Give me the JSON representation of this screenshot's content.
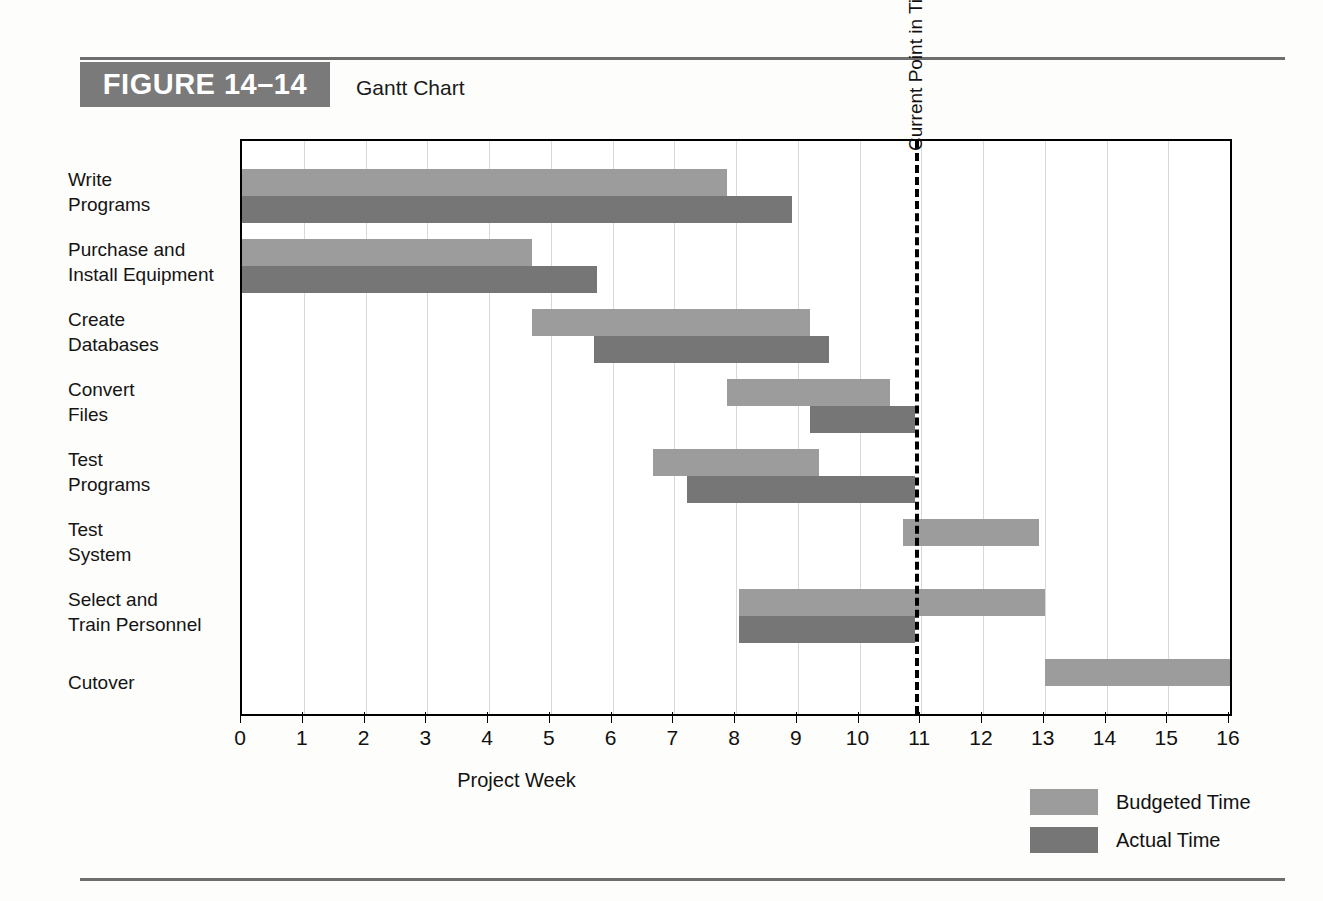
{
  "figure": {
    "tag": "FIGURE 14–14",
    "title": "Gantt Chart"
  },
  "chart_data": {
    "type": "bar",
    "orientation": "horizontal",
    "subtype": "gantt",
    "title": "Gantt Chart",
    "xlabel": "Project Week",
    "ylabel": "",
    "xlim": [
      0,
      16
    ],
    "xticks": [
      0,
      1,
      2,
      3,
      4,
      5,
      6,
      7,
      8,
      9,
      10,
      11,
      12,
      13,
      14,
      15,
      16
    ],
    "grid": true,
    "legend_position": "bottom-right",
    "legend": [
      "Budgeted Time",
      "Actual Time"
    ],
    "annotations": [
      {
        "label": "Current Point in Time",
        "x": 10.9,
        "type": "vertical-dashed-line"
      }
    ],
    "categories": [
      "Write Programs",
      "Purchase and Install Equipment",
      "Create Databases",
      "Convert Files",
      "Test Programs",
      "Test System",
      "Select and Train Personnel",
      "Cutover"
    ],
    "tasks": [
      {
        "name": "Write Programs",
        "label_lines": [
          "Write",
          "Programs"
        ],
        "budgeted": {
          "start": 0,
          "end": 7.85
        },
        "actual": {
          "start": 0,
          "end": 8.9
        }
      },
      {
        "name": "Purchase and Install Equipment",
        "label_lines": [
          "Purchase and",
          "Install Equipment"
        ],
        "budgeted": {
          "start": 0,
          "end": 4.7
        },
        "actual": {
          "start": 0,
          "end": 5.75
        }
      },
      {
        "name": "Create Databases",
        "label_lines": [
          "Create",
          "Databases"
        ],
        "budgeted": {
          "start": 4.7,
          "end": 9.2
        },
        "actual": {
          "start": 5.7,
          "end": 9.5
        }
      },
      {
        "name": "Convert Files",
        "label_lines": [
          "Convert",
          "Files"
        ],
        "budgeted": {
          "start": 7.85,
          "end": 10.5
        },
        "actual": {
          "start": 9.2,
          "end": 10.9
        }
      },
      {
        "name": "Test Programs",
        "label_lines": [
          "Test",
          "Programs"
        ],
        "budgeted": {
          "start": 6.65,
          "end": 9.35
        },
        "actual": {
          "start": 7.2,
          "end": 10.9
        }
      },
      {
        "name": "Test System",
        "label_lines": [
          "Test",
          "System"
        ],
        "budgeted": {
          "start": 10.7,
          "end": 12.9
        },
        "actual": null
      },
      {
        "name": "Select and Train Personnel",
        "label_lines": [
          "Select and",
          "Train Personnel"
        ],
        "budgeted": {
          "start": 8.05,
          "end": 13.0
        },
        "actual": {
          "start": 8.05,
          "end": 10.9
        }
      },
      {
        "name": "Cutover",
        "label_lines": [
          "Cutover"
        ],
        "budgeted": {
          "start": 13.0,
          "end": 16.0
        },
        "actual": null
      }
    ]
  },
  "legend": {
    "budgeted_label": "Budgeted Time",
    "actual_label": "Actual Time"
  },
  "axis": {
    "title": "Project Week",
    "current_point_label": "Current Point in Time"
  },
  "colors": {
    "budgeted": "#9c9c9c",
    "actual": "#767676",
    "tag_background": "#7a7a7a",
    "rule": "#6e6e6e",
    "gridline": "#d8d8d8"
  }
}
